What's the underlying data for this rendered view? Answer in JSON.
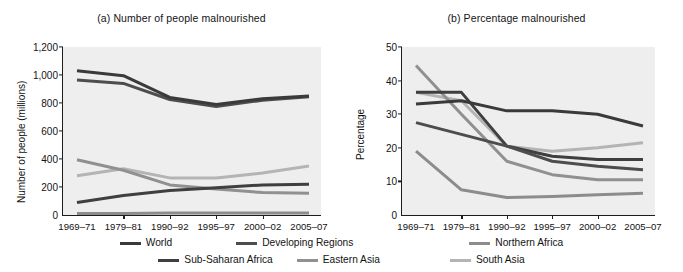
{
  "figure": {
    "panel_a_title": "(a) Number of people malnourished",
    "panel_b_title": "(b) Percentage malnourished"
  },
  "legend": {
    "position": "bottom",
    "rows": [
      [
        {
          "label": "World",
          "color": "#3a3a3a"
        },
        {
          "label": "Developing Regions",
          "color": "#4d4d4d"
        },
        {
          "label": "Northern Africa",
          "color": "#8c8c8c"
        }
      ],
      [
        {
          "label": "Sub-Saharan Africa",
          "color": "#3f3f3f"
        },
        {
          "label": "Eastern Asia",
          "color": "#909090"
        },
        {
          "label": "South Asia",
          "color": "#b4b4b4"
        }
      ]
    ]
  },
  "chart_data": [
    {
      "type": "line",
      "title": "(a) Number of people malnourished",
      "xlabel": "",
      "ylabel": "Number of people (millions)",
      "categories": [
        "1969–71",
        "1979–81",
        "1990–92",
        "1995–97",
        "2000–02",
        "2005–07"
      ],
      "ylim": [
        0,
        1200
      ],
      "yticks": [
        "0",
        "200",
        "400",
        "600",
        "800",
        "1,000",
        "1,200"
      ],
      "ytick_values": [
        0,
        200,
        400,
        600,
        800,
        1000,
        1200
      ],
      "grid": false,
      "legend_position": "bottom",
      "series": [
        {
          "name": "World",
          "color": "#3a3a3a",
          "width": 3.0,
          "values": [
            1030,
            995,
            840,
            790,
            830,
            850
          ]
        },
        {
          "name": "Developing Regions",
          "color": "#4d4d4d",
          "width": 3.0,
          "values": [
            965,
            940,
            825,
            775,
            820,
            845
          ]
        },
        {
          "name": "Northern Africa",
          "color": "#8c8c8c",
          "width": 3.0,
          "values": [
            10,
            10,
            15,
            15,
            15,
            15
          ]
        },
        {
          "name": "Sub-Saharan Africa",
          "color": "#3f3f3f",
          "width": 3.0,
          "values": [
            90,
            140,
            175,
            195,
            215,
            220
          ]
        },
        {
          "name": "Eastern Asia",
          "color": "#909090",
          "width": 3.0,
          "values": [
            395,
            320,
            215,
            185,
            160,
            155
          ]
        },
        {
          "name": "South Asia",
          "color": "#b4b4b4",
          "width": 3.0,
          "values": [
            280,
            330,
            265,
            265,
            300,
            350
          ]
        }
      ]
    },
    {
      "type": "line",
      "title": "(b) Percentage malnourished",
      "xlabel": "",
      "ylabel": "Percentage",
      "categories": [
        "1969–71",
        "1979–81",
        "1990–92",
        "1995–97",
        "2000–02",
        "2005–07"
      ],
      "ylim": [
        0,
        50
      ],
      "yticks": [
        "0",
        "10",
        "20",
        "30",
        "40",
        "50"
      ],
      "ytick_values": [
        0,
        10,
        20,
        30,
        40,
        50
      ],
      "grid": false,
      "legend_position": "bottom",
      "series": [
        {
          "name": "World",
          "color": "#3a3a3a",
          "width": 3.0,
          "values": [
            33.0,
            34.0,
            31.0,
            31.0,
            30.0,
            26.5
          ]
        },
        {
          "name": "Developing Regions",
          "color": "#4d4d4d",
          "width": 3.0,
          "values": [
            27.5,
            24.0,
            20.5,
            16.0,
            14.5,
            13.5
          ]
        },
        {
          "name": "Northern Africa",
          "color": "#8c8c8c",
          "width": 3.0,
          "values": [
            19.0,
            7.5,
            5.2,
            5.5,
            6.0,
            6.5
          ]
        },
        {
          "name": "Sub-Saharan Africa",
          "color": "#3f3f3f",
          "width": 3.0,
          "values": [
            36.5,
            36.5,
            20.5,
            17.5,
            16.5,
            16.5
          ]
        },
        {
          "name": "Eastern Asia",
          "color": "#909090",
          "width": 3.0,
          "values": [
            44.5,
            30.0,
            16.0,
            12.0,
            10.5,
            10.5
          ]
        },
        {
          "name": "South Asia",
          "color": "#b4b4b4",
          "width": 3.0,
          "values": [
            36.5,
            34.0,
            20.5,
            19.0,
            20.0,
            21.5
          ]
        }
      ]
    }
  ]
}
